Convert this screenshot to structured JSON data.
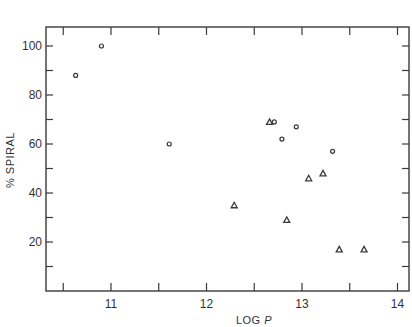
{
  "chart_data": {
    "type": "scatter",
    "title": "",
    "xlabel": "LOG P",
    "ylabel": "% SPIRAL",
    "xlim": [
      10.35,
      14.15
    ],
    "ylim": [
      0,
      107
    ],
    "x_ticks_major": [
      11,
      12,
      13,
      14
    ],
    "x_ticks_minor": [
      10.5,
      11.5,
      12.5,
      13.5
    ],
    "y_ticks_major": [
      20,
      40,
      60,
      80,
      100
    ],
    "y_ticks_minor": [
      10,
      30,
      50,
      70,
      90
    ],
    "grid": false,
    "legend": null,
    "series": [
      {
        "name": "circles",
        "marker": "circle",
        "points": [
          {
            "x": 10.63,
            "y": 88
          },
          {
            "x": 10.9,
            "y": 100
          },
          {
            "x": 11.61,
            "y": 60
          },
          {
            "x": 12.71,
            "y": 69
          },
          {
            "x": 12.79,
            "y": 62
          },
          {
            "x": 12.94,
            "y": 67
          },
          {
            "x": 13.32,
            "y": 57
          }
        ]
      },
      {
        "name": "triangles",
        "marker": "triangle",
        "points": [
          {
            "x": 12.29,
            "y": 35
          },
          {
            "x": 12.66,
            "y": 69
          },
          {
            "x": 12.84,
            "y": 29
          },
          {
            "x": 13.07,
            "y": 46
          },
          {
            "x": 13.22,
            "y": 48
          },
          {
            "x": 13.39,
            "y": 17
          },
          {
            "x": 13.65,
            "y": 17
          }
        ]
      }
    ]
  },
  "colors": {
    "axis": "#3a3a3a",
    "marker": "#3a3a3a"
  }
}
